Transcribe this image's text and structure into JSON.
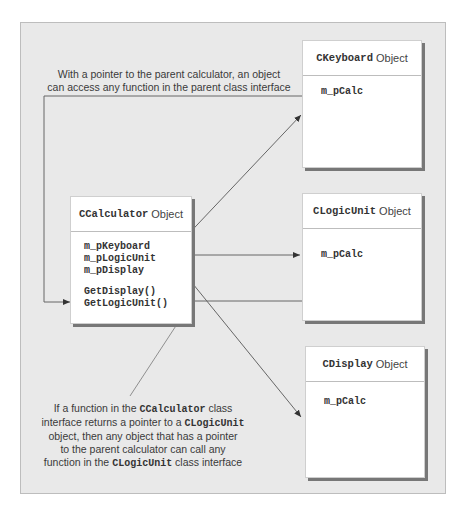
{
  "top_note": {
    "line1": "With a pointer to the parent calculator, an object",
    "line2": "can access any function in the parent class interface"
  },
  "objects": {
    "calculator": {
      "class_name": "CCalculator",
      "suffix": "Object",
      "members": [
        "m_pKeyboard",
        "m_pLogicUnit",
        "m_pDisplay"
      ],
      "functions": [
        "GetDisplay()",
        "GetLogicUnit()"
      ]
    },
    "keyboard": {
      "class_name": "CKeyboard",
      "suffix": "Object",
      "members": [
        "m_pCalc"
      ]
    },
    "logic_unit": {
      "class_name": "CLogicUnit",
      "suffix": "Object",
      "members": [
        "m_pCalc"
      ]
    },
    "display": {
      "class_name": "CDisplay",
      "suffix": "Object",
      "members": [
        "m_pCalc"
      ]
    }
  },
  "bottom_note": {
    "l1_a": "If a function in the ",
    "l1_code": "CCalculator",
    "l1_b": " class",
    "l2_a": "interface returns a pointer to a ",
    "l2_code": "CLogicUnit",
    "l3": "object, then any object that has a pointer",
    "l4": "to the parent calculator can call any",
    "l5_a": "function in the ",
    "l5_code": "CLogicUnit",
    "l5_b": " class interface"
  },
  "colors": {
    "frame_bg": "#e9e9e9",
    "box_bg": "#ffffff",
    "line": "#555555",
    "shadow": "#777777"
  }
}
